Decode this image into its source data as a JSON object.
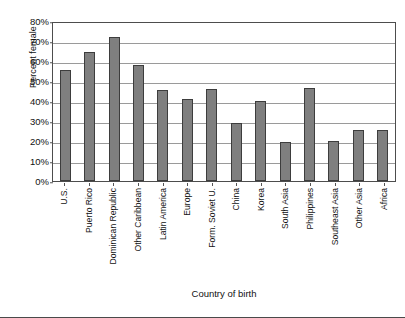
{
  "chart_data": {
    "type": "bar",
    "title": "",
    "xlabel": "Country of birth",
    "ylabel": "Percent female",
    "ylim": [
      0,
      80
    ],
    "ytick_labels": [
      "80%",
      "70%",
      "60%",
      "50%",
      "40%",
      "30%",
      "20%",
      "10%",
      "0%"
    ],
    "ytick_values": [
      80,
      70,
      60,
      50,
      40,
      30,
      20,
      10,
      0
    ],
    "grid": true,
    "legend": "none",
    "bar_color": "#7f7f7f",
    "bar_edge_color": "#3d3d3d",
    "categories": [
      "U.S.",
      "Puerto Rico",
      "Dominican Republic",
      "Other Caribbean",
      "Latin America",
      "Europe",
      "Form. Soviet U.",
      "China",
      "Korea",
      "South Asia",
      "Philippines",
      "Southeast Asia",
      "Other Asia",
      "Africa"
    ],
    "values": [
      55.5,
      64.5,
      72,
      58,
      45.5,
      41,
      46,
      29,
      40,
      19.5,
      46.5,
      20,
      25.5,
      25.5
    ]
  }
}
